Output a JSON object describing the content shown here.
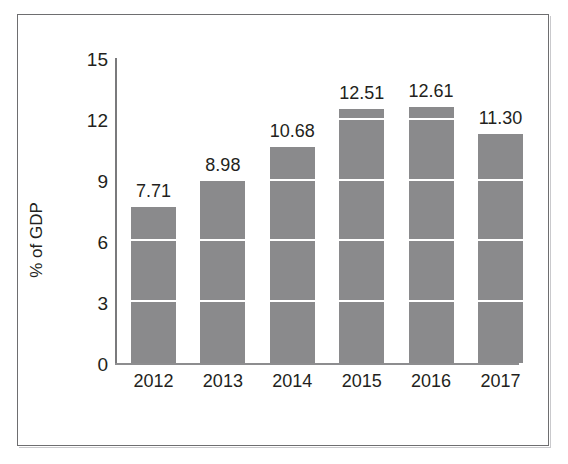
{
  "chart_data": {
    "type": "bar",
    "title": "",
    "subtitle": "",
    "xlabel": "",
    "ylabel": "% of GDP",
    "categories": [
      "2012",
      "2013",
      "2014",
      "2015",
      "2016",
      "2017"
    ],
    "values": [
      7.71,
      8.98,
      10.68,
      12.51,
      12.61,
      11.3
    ],
    "value_labels": [
      "7.71",
      "8.98",
      "10.68",
      "12.51",
      "12.61",
      "11.30"
    ],
    "ylim": [
      0,
      15
    ],
    "yticks": [
      0,
      3,
      6,
      9,
      12,
      15
    ],
    "ytick_labels": [
      "0",
      "3",
      "6",
      "9",
      "12",
      "15"
    ],
    "grid": "horizontal-white-over-bars",
    "legend": "none",
    "series": [
      {
        "name": "% of GDP",
        "values": [
          7.71,
          8.98,
          10.68,
          12.51,
          12.61,
          11.3
        ],
        "color": "#8a8a8c"
      }
    ],
    "colors": {
      "bar": "#8a8a8c",
      "gridline": "#ffffff",
      "axis": "#7a7a7c",
      "text": "#231f20",
      "frame": "#6e6e70",
      "background": "#ffffff"
    }
  }
}
